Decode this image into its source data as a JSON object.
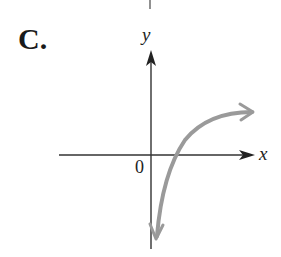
{
  "figure": {
    "option_label": "C.",
    "x_axis_label": "x",
    "y_axis_label": "y",
    "origin_label": "0",
    "colors": {
      "axes": "#333333",
      "curve": "#9a9a9a",
      "text": "#222222"
    },
    "curve_description": "Logarithmic-shaped curve crossing positive x-axis, arrow upward-right and downward toward the y-axis asymptote"
  }
}
